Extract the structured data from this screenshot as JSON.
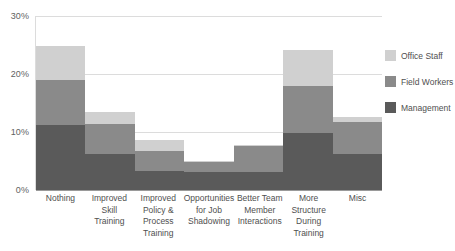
{
  "chart_data": {
    "type": "bar",
    "stacked": true,
    "title": "",
    "xlabel": "",
    "ylabel": "",
    "ylim": [
      0,
      30
    ],
    "y_ticks": [
      0,
      10,
      20,
      30
    ],
    "y_tick_labels": [
      "0%",
      "10%",
      "20%",
      "30%"
    ],
    "grid": true,
    "legend_position": "right",
    "categories": [
      "Nothing",
      "Improved Skill Training",
      "Improved Policy & Process Training",
      "Opportunities for Job Shadowing",
      "Better Team Member Interactions",
      "More Structure During Training",
      "Misc"
    ],
    "category_lines": [
      [
        "Nothing"
      ],
      [
        "Improved Skill",
        "Training"
      ],
      [
        "Improved",
        "Policy &",
        "Process",
        "Training"
      ],
      [
        "Opportunities",
        "for Job",
        "Shadowing"
      ],
      [
        "Better Team",
        "Member",
        "Interactions"
      ],
      [
        "More Structure",
        "During Training"
      ],
      [
        "Misc"
      ]
    ],
    "series": [
      {
        "name": "Management",
        "color": "#5a5a5a",
        "values": [
          11.2,
          6.2,
          3.3,
          3.1,
          3.1,
          9.8,
          6.2
        ]
      },
      {
        "name": "Field Workers",
        "color": "#8a8a8a",
        "values": [
          7.8,
          5.2,
          3.4,
          1.7,
          4.5,
          8.1,
          5.5
        ]
      },
      {
        "name": "Office Staff",
        "color": "#d0d0d0",
        "values": [
          5.8,
          2.1,
          2.0,
          0.2,
          0.2,
          6.2,
          0.9
        ]
      }
    ],
    "totals": [
      24.8,
      13.5,
      8.7,
      5.0,
      7.8,
      24.1,
      12.6
    ]
  },
  "legend": {
    "items": [
      {
        "label": "Office Staff",
        "color": "#d0d0d0"
      },
      {
        "label": "Field Workers",
        "color": "#8a8a8a"
      },
      {
        "label": "Management",
        "color": "#5a5a5a"
      }
    ]
  },
  "colors": {
    "office_staff": "#d0d0d0",
    "field_workers": "#8a8a8a",
    "management": "#5a5a5a",
    "gridline": "#dcdcdc",
    "axis": "#9a9a9a",
    "text": "#4f4f4f",
    "background": "#ffffff"
  }
}
